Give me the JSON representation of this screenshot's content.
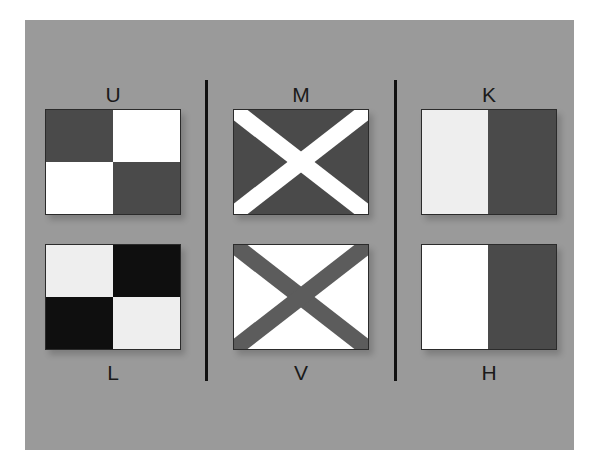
{
  "colors": {
    "panel_bg": "#9a9a9a",
    "dark": "#4a4a4a",
    "black": "#0f0f0f",
    "white": "#ffffff",
    "light": "#eeeeee",
    "mid": "#5c5c5c"
  },
  "flags": [
    {
      "letter": "U",
      "pattern": "quartered",
      "colors": [
        "#4a4a4a",
        "#ffffff",
        "#ffffff",
        "#4a4a4a"
      ]
    },
    {
      "letter": "L",
      "pattern": "quartered",
      "colors": [
        "#eeeeee",
        "#0f0f0f",
        "#0f0f0f",
        "#eeeeee"
      ]
    },
    {
      "letter": "M",
      "pattern": "saltire",
      "field": "#4a4a4a",
      "cross": "#ffffff"
    },
    {
      "letter": "V",
      "pattern": "saltire",
      "field": "#ffffff",
      "cross": "#5c5c5c"
    },
    {
      "letter": "K",
      "pattern": "vertical-bicolor",
      "colors": [
        "#eeeeee",
        "#4a4a4a"
      ]
    },
    {
      "letter": "H",
      "pattern": "vertical-bicolor",
      "colors": [
        "#ffffff",
        "#4a4a4a"
      ]
    }
  ]
}
